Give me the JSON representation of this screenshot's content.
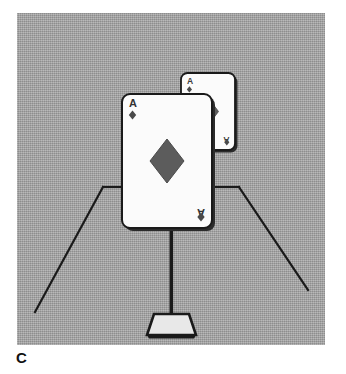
{
  "figure": {
    "label": "C",
    "caption_letter": "C",
    "scene_description": "Two playing cards mounted on a pedestal stand in a room corner"
  },
  "colors": {
    "background": "#ffffff",
    "panel_gray": "#9e9e9e",
    "ink_black": "#1a1a1a",
    "card_white": "#fbfbfb",
    "pip_gray": "#595959",
    "card_shadow": "#2b2b2b"
  },
  "scene": {
    "room": {
      "back_wall_line_label": "back-wall-floor-line",
      "left_edge_line_label": "left-floor-edge",
      "right_edge_line_label": "right-floor-edge"
    },
    "stand": {
      "pole_label": "stand-pole",
      "base_label": "stand-base"
    }
  },
  "cards": [
    {
      "id": "back-card",
      "rank": "A",
      "suit": "diamonds",
      "suit_symbol": "♦",
      "corner_rank_top": "A",
      "corner_rank_bottom": "A",
      "position": "upper-right, partially behind front card",
      "x": 178,
      "y": 70,
      "width": 54,
      "height": 77
    },
    {
      "id": "front-card",
      "rank": "A",
      "suit": "diamonds",
      "suit_symbol": "♦",
      "corner_rank_top": "A",
      "corner_rank_bottom": "A",
      "position": "center, front",
      "x": 122,
      "y": 94,
      "width": 90,
      "height": 134
    }
  ]
}
